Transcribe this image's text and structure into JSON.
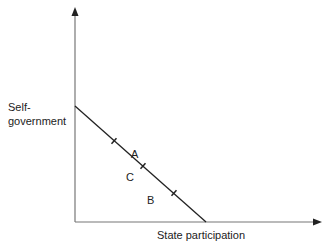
{
  "diagram": {
    "y_axis_label_line1": "Self-",
    "y_axis_label_line2": "government",
    "x_axis_label": "State participation",
    "regions": [
      {
        "label": "A",
        "x": 131,
        "y": 148
      },
      {
        "label": "C",
        "x": 126,
        "y": 170
      },
      {
        "label": "B",
        "x": 147,
        "y": 194
      }
    ],
    "line": {
      "start": {
        "x": 75,
        "y": 106
      },
      "end": {
        "x": 206,
        "y": 222
      },
      "tick_marks": [
        {
          "x": 114,
          "y": 141
        },
        {
          "x": 143,
          "y": 166
        },
        {
          "x": 174,
          "y": 193
        }
      ]
    },
    "axes": {
      "origin": {
        "x": 75,
        "y": 222
      },
      "y_top": 8,
      "x_right": 322
    },
    "colors": {
      "axis": "#777777",
      "line": "#222222",
      "text": "#222222"
    }
  }
}
